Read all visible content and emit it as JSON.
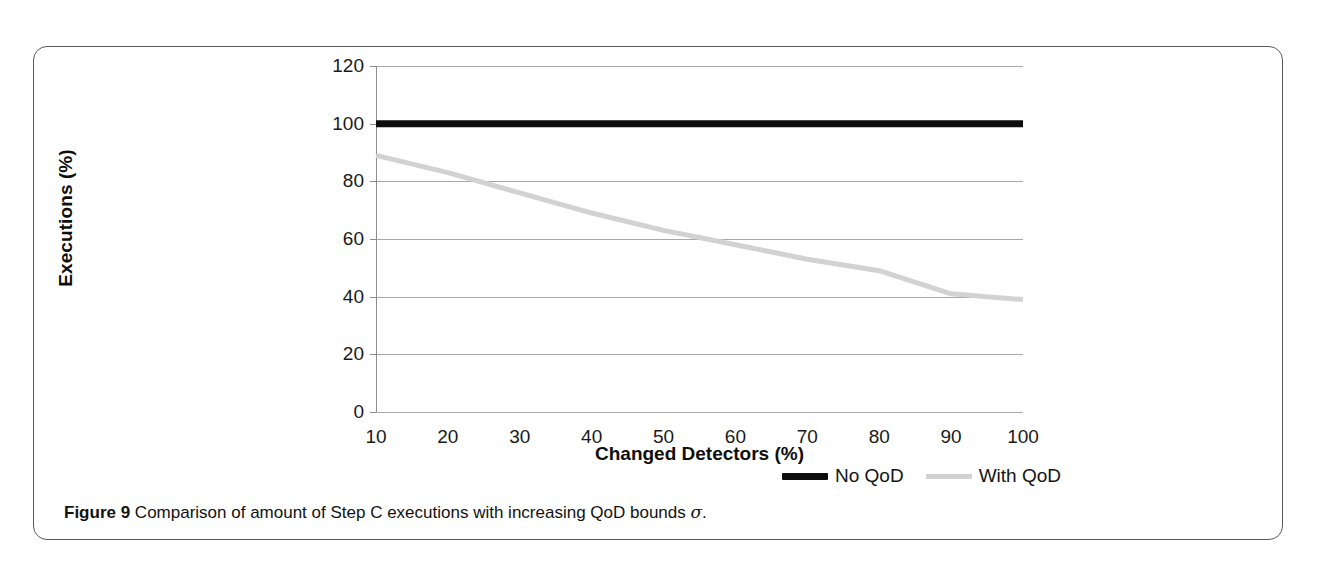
{
  "figure": {
    "caption_label": "Figure 9",
    "caption_text": "Comparison of amount of Step C executions with increasing QoD bounds",
    "caption_symbol": "σ",
    "caption_end": "."
  },
  "legend": {
    "position": "bottom-right",
    "entries": [
      {
        "label": "No QoD",
        "color": "#0d0d0d",
        "style": "thick-solid"
      },
      {
        "label": "With QoD",
        "color": "#d2d2d2",
        "style": "thin-solid"
      }
    ]
  },
  "axes": {
    "x_title": "Changed Detectors (%)",
    "y_title": "Executions (%)",
    "y_ticks": [
      "0",
      "20",
      "40",
      "60",
      "80",
      "100",
      "120"
    ],
    "x_ticks": [
      "10",
      "20",
      "30",
      "40",
      "50",
      "60",
      "70",
      "80",
      "90",
      "100"
    ]
  },
  "chart_data": {
    "type": "line",
    "title": "",
    "xlabel": "Changed Detectors (%)",
    "ylabel": "Executions (%)",
    "xlim": [
      10,
      100
    ],
    "ylim": [
      0,
      120
    ],
    "x": [
      10,
      20,
      30,
      40,
      50,
      60,
      70,
      80,
      90,
      100
    ],
    "grid": true,
    "legend_position": "bottom-right",
    "series": [
      {
        "name": "No QoD",
        "color": "#0d0d0d",
        "width": 7,
        "values": [
          100,
          100,
          100,
          100,
          100,
          100,
          100,
          100,
          100,
          100
        ]
      },
      {
        "name": "With QoD",
        "color": "#d2d2d2",
        "width": 5,
        "values": [
          89,
          83,
          76,
          69,
          63,
          58,
          53,
          49,
          41,
          39
        ]
      }
    ]
  }
}
